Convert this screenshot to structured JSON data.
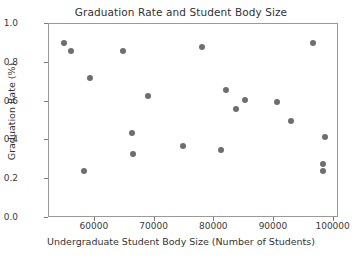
{
  "chart_data": {
    "type": "scatter",
    "title": "Graduation Rate and Student Body Size",
    "xlabel": "Undergraduate Student Body Size (Number of Students)",
    "ylabel": "Graduation Rate (%)",
    "xlim": [
      52300,
      100900
    ],
    "ylim": [
      0.0,
      1.0
    ],
    "xticks": [
      60000,
      70000,
      80000,
      90000,
      100000
    ],
    "xtick_labels": [
      "60000",
      "70000",
      "80000",
      "90000",
      "100000"
    ],
    "yticks": [
      0.0,
      0.2,
      0.4,
      0.6,
      0.8,
      1.0
    ],
    "ytick_labels": [
      "0.0",
      "0.2",
      "0.4",
      "0.6",
      "0.8",
      "1.0"
    ],
    "grid": false,
    "legend": null,
    "marker_color": "#6e6e6e",
    "marker_size": 6,
    "points": [
      {
        "x": 54800,
        "y": 0.9
      },
      {
        "x": 56000,
        "y": 0.86
      },
      {
        "x": 58200,
        "y": 0.24
      },
      {
        "x": 59100,
        "y": 0.72
      },
      {
        "x": 64750,
        "y": 0.86
      },
      {
        "x": 66200,
        "y": 0.44
      },
      {
        "x": 66450,
        "y": 0.33
      },
      {
        "x": 68900,
        "y": 0.63
      },
      {
        "x": 74700,
        "y": 0.37
      },
      {
        "x": 78000,
        "y": 0.88
      },
      {
        "x": 81100,
        "y": 0.35
      },
      {
        "x": 82000,
        "y": 0.66
      },
      {
        "x": 83650,
        "y": 0.56
      },
      {
        "x": 85200,
        "y": 0.61
      },
      {
        "x": 90500,
        "y": 0.6
      },
      {
        "x": 92800,
        "y": 0.5
      },
      {
        "x": 96550,
        "y": 0.9
      },
      {
        "x": 98550,
        "y": 0.42
      },
      {
        "x": 98300,
        "y": 0.28
      },
      {
        "x": 98300,
        "y": 0.24
      }
    ]
  }
}
